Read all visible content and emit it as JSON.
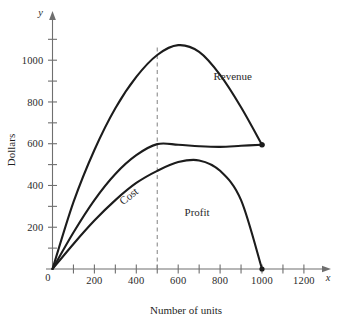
{
  "chart_data": {
    "type": "line",
    "title": "",
    "xlabel": "Number of units",
    "ylabel": "Dollars",
    "x_axis_name": "x",
    "y_axis_name": "y",
    "origin_label": "0",
    "xlim": [
      0,
      1300
    ],
    "ylim": [
      0,
      1120
    ],
    "grid": false,
    "legend_position": "inline-annotations",
    "x_ticks_major": [
      200,
      400,
      600,
      800,
      1000,
      1200
    ],
    "x_tick_labels": [
      "200",
      "400",
      "600",
      "800",
      "1000",
      "1200"
    ],
    "x_ticks_minor": [
      100,
      300,
      500,
      700,
      900,
      1100
    ],
    "y_ticks_major": [
      200,
      400,
      600,
      800,
      1000
    ],
    "y_tick_labels": [
      "200",
      "400",
      "600",
      "800",
      "1000"
    ],
    "y_ticks_minor": [
      100,
      300,
      500,
      700,
      900,
      1100
    ],
    "annotations": [
      {
        "text": "Revenue",
        "x": 860,
        "y": 905,
        "rotation": 0
      },
      {
        "text": "Cost",
        "x": 375,
        "y": 335,
        "rotation": -38
      },
      {
        "text": "Profit",
        "x": 690,
        "y": 255,
        "rotation": 0
      }
    ],
    "reference_line": {
      "kind": "vertical-dashed",
      "x": 500,
      "y_top": 1075,
      "label": ""
    },
    "series": [
      {
        "name": "Revenue",
        "color": "#1c1c1c",
        "points": [
          {
            "x": 0,
            "y": 0
          },
          {
            "x": 100,
            "y": 320
          },
          {
            "x": 200,
            "y": 570
          },
          {
            "x": 300,
            "y": 770
          },
          {
            "x": 400,
            "y": 920
          },
          {
            "x": 500,
            "y": 1025
          },
          {
            "x": 600,
            "y": 1072
          },
          {
            "x": 700,
            "y": 1040
          },
          {
            "x": 800,
            "y": 930
          },
          {
            "x": 900,
            "y": 775
          },
          {
            "x": 1000,
            "y": 595
          }
        ],
        "endpoint_marker": {
          "x": 1000,
          "y": 595
        }
      },
      {
        "name": "Cost",
        "color": "#1c1c1c",
        "points": [
          {
            "x": 0,
            "y": 0
          },
          {
            "x": 100,
            "y": 175
          },
          {
            "x": 200,
            "y": 330
          },
          {
            "x": 300,
            "y": 455
          },
          {
            "x": 400,
            "y": 545
          },
          {
            "x": 500,
            "y": 598
          },
          {
            "x": 600,
            "y": 595
          },
          {
            "x": 700,
            "y": 588
          },
          {
            "x": 800,
            "y": 585
          },
          {
            "x": 900,
            "y": 590
          },
          {
            "x": 1000,
            "y": 595
          }
        ],
        "endpoint_marker": {
          "x": 1000,
          "y": 595
        }
      },
      {
        "name": "Profit",
        "color": "#1c1c1c",
        "points": [
          {
            "x": 0,
            "y": 0
          },
          {
            "x": 100,
            "y": 120
          },
          {
            "x": 200,
            "y": 232
          },
          {
            "x": 300,
            "y": 330
          },
          {
            "x": 400,
            "y": 412
          },
          {
            "x": 500,
            "y": 470
          },
          {
            "x": 600,
            "y": 512
          },
          {
            "x": 700,
            "y": 520
          },
          {
            "x": 800,
            "y": 470
          },
          {
            "x": 900,
            "y": 330
          },
          {
            "x": 1000,
            "y": 0
          }
        ],
        "endpoint_marker": {
          "x": 1000,
          "y": 0
        }
      }
    ]
  }
}
